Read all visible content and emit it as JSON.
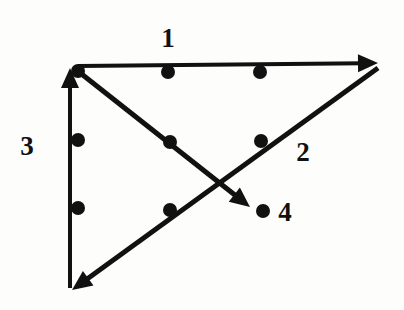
{
  "figure": {
    "width": 404,
    "height": 310,
    "background_color": "#fdfdfc",
    "ink_color": "#111111"
  },
  "chart_data": {
    "type": "diagram",
    "xlabel": "",
    "ylabel": "",
    "xlim": [
      0,
      404
    ],
    "ylim": [
      310,
      0
    ],
    "grid": false,
    "legend": "none",
    "segments": [
      {
        "label": "1",
        "name": "segment-1",
        "description": "horizontal arrow pointing right along the top edge",
        "start": [
          78,
          66
        ],
        "end": [
          378,
          63
        ],
        "arrow_at": "end",
        "stroke_width": 4,
        "label_position": [
          168,
          38
        ],
        "label_anchor": "above-middle"
      },
      {
        "label": "2",
        "name": "segment-2",
        "description": "diagonal arrow pointing down-left, from the top-right corner to the bottom-left corner (hypotenuse)",
        "start": [
          378,
          68
        ],
        "end": [
          72,
          290
        ],
        "arrow_at": "end",
        "stroke_width": 5,
        "label_position": [
          303,
          152
        ],
        "label_anchor": "right-of-line"
      },
      {
        "label": "3",
        "name": "segment-3",
        "description": "vertical arrow pointing up along the left edge",
        "start": [
          70,
          288
        ],
        "end": [
          70,
          68
        ],
        "arrow_at": "end",
        "stroke_width": 4,
        "label_position": [
          27,
          146
        ],
        "label_anchor": "left-of-line"
      },
      {
        "label": "4",
        "name": "segment-4",
        "description": "interior diagonal arrow pointing down-right from the top-left corner, crossing segment 2",
        "start": [
          79,
          72
        ],
        "end": [
          250,
          207
        ],
        "arrow_at": "end",
        "stroke_width": 5,
        "label_position": [
          285,
          212
        ],
        "label_anchor": "right-of-arrowhead"
      }
    ],
    "points": [
      {
        "name": "point-corner-top-left",
        "on_segment": "1",
        "x": 78,
        "y": 71,
        "radius": 7
      },
      {
        "name": "point-top-mid",
        "on_segment": "1",
        "x": 168,
        "y": 72,
        "radius": 7
      },
      {
        "name": "point-top-right-mid",
        "on_segment": "1",
        "x": 260,
        "y": 72,
        "radius": 7
      },
      {
        "name": "point-left-upper",
        "on_segment": "3",
        "x": 78,
        "y": 140,
        "radius": 7
      },
      {
        "name": "point-left-lower",
        "on_segment": "3",
        "x": 78,
        "y": 208,
        "radius": 7
      },
      {
        "name": "point-segment4-mid",
        "on_segment": "4",
        "x": 170,
        "y": 142,
        "radius": 7
      },
      {
        "name": "point-segment2-upper",
        "on_segment": "2",
        "x": 261,
        "y": 141,
        "radius": 7
      },
      {
        "name": "point-segment2-lower",
        "on_segment": "2",
        "x": 170,
        "y": 210,
        "radius": 7
      },
      {
        "name": "point-near-label-4",
        "on_segment": "4",
        "x": 263,
        "y": 211,
        "radius": 7
      }
    ],
    "labels": [
      "1",
      "2",
      "3",
      "4"
    ]
  }
}
